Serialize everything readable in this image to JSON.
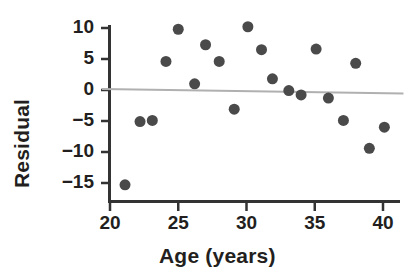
{
  "chart_data": {
    "type": "scatter",
    "title": "",
    "xlabel": "Age (years)",
    "ylabel": "Residual",
    "xlim": [
      19.3,
      41.3
    ],
    "ylim": [
      -17.3,
      11.5
    ],
    "xticks": [
      20,
      25,
      30,
      35,
      40
    ],
    "xtick_labels": [
      "20",
      "25",
      "30",
      "35",
      "40"
    ],
    "yticks": [
      10,
      5,
      0,
      -5,
      -10,
      -15
    ],
    "ytick_labels": [
      "10",
      "5",
      "0",
      "−5",
      "−10",
      "−15"
    ],
    "grid": false,
    "legend": null,
    "marker": {
      "shape": "circle",
      "color": "#4a4a4a",
      "size_px": 11
    },
    "reference_line": {
      "name": "zero-trend-line",
      "color": "#b0b0b0",
      "x_start": 19.4,
      "y_start": 0.15,
      "x_end": 41.5,
      "y_end": -0.55
    },
    "points": [
      {
        "x": 21.1,
        "y": -15.3
      },
      {
        "x": 22.2,
        "y": -5.1
      },
      {
        "x": 23.1,
        "y": -4.9
      },
      {
        "x": 24.1,
        "y": 4.6
      },
      {
        "x": 25.0,
        "y": 9.8
      },
      {
        "x": 26.2,
        "y": 1.0
      },
      {
        "x": 27.0,
        "y": 7.3
      },
      {
        "x": 28.0,
        "y": 4.6
      },
      {
        "x": 29.1,
        "y": -3.1
      },
      {
        "x": 30.1,
        "y": 10.2
      },
      {
        "x": 31.1,
        "y": 6.5
      },
      {
        "x": 31.9,
        "y": 1.8
      },
      {
        "x": 33.1,
        "y": -0.1
      },
      {
        "x": 34.0,
        "y": -0.8
      },
      {
        "x": 35.1,
        "y": 6.6
      },
      {
        "x": 36.0,
        "y": -1.3
      },
      {
        "x": 37.1,
        "y": -4.9
      },
      {
        "x": 38.0,
        "y": 4.3
      },
      {
        "x": 39.0,
        "y": -9.4
      },
      {
        "x": 40.1,
        "y": -6.0
      }
    ],
    "axis_color": "#333333",
    "background_color": "#ffffff"
  }
}
